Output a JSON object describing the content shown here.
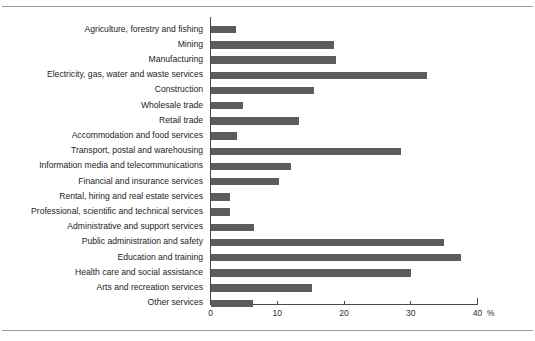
{
  "figure": {
    "background_color": "#ffffff",
    "bar_color": "#5c5c5c",
    "axis_color": "#4a4a4a",
    "rule_color": "#9b9b9b"
  },
  "axis": {
    "unit_label": "%",
    "tick_labels": [
      "0",
      "10",
      "20",
      "30",
      "40"
    ]
  },
  "chart_data": {
    "type": "bar",
    "orientation": "horizontal",
    "title": "",
    "subtitle": "",
    "xlabel": "%",
    "ylabel": "",
    "xlim": [
      0,
      40
    ],
    "xticks": [
      0,
      10,
      20,
      30,
      40
    ],
    "grid": false,
    "legend": null,
    "categories": [
      "Agriculture, forestry and fishing",
      "Mining",
      "Manufacturing",
      "Electricity, gas, water and waste services",
      "Construction",
      "Wholesale trade",
      "Retail trade",
      "Accommodation and food services",
      "Transport, postal and warehousing",
      "Information media and telecommunications",
      "Financial and insurance services",
      "Rental, hiring and real estate services",
      "Professional, scientific and technical services",
      "Administrative and support services",
      "Public administration and safety",
      "Education and training",
      "Health care and social assistance",
      "Arts and recreation services",
      "Other services"
    ],
    "values": [
      3.7,
      18.5,
      18.8,
      32.4,
      15.4,
      4.8,
      13.2,
      3.9,
      28.5,
      12.0,
      10.2,
      2.9,
      2.9,
      6.5,
      34.9,
      37.4,
      30.0,
      15.1,
      6.3
    ]
  }
}
